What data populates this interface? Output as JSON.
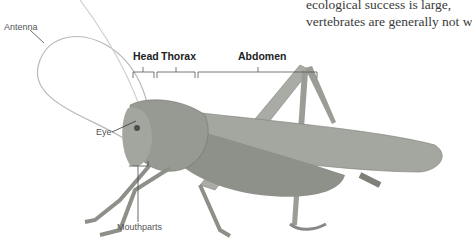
{
  "body_text": {
    "line1": "ecological success is large,",
    "line2": "vertebrates are generally not w"
  },
  "diagram": {
    "labels": {
      "antenna": "Antenna",
      "eye": "Eye",
      "mouthparts": "Mouthparts",
      "head": "Head",
      "thorax": "Thorax",
      "abdomen": "Abdomen"
    }
  }
}
